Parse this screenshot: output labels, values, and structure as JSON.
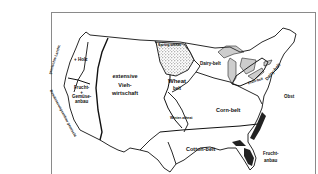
{
  "map": {
    "title": "",
    "subject": "Agricultural belts of the United States (German labels)",
    "colors": {
      "line": "#111111",
      "frame": "#8a8a8a",
      "background": "#ffffff",
      "hatch": "#555555"
    },
    "regions": [
      {
        "id": "holz",
        "label": "+ Holz"
      },
      {
        "id": "frucht-west",
        "label_lines": [
          "Frucht-",
          "+",
          "Gemüse-",
          "anbau"
        ]
      },
      {
        "id": "viehwirtschaft",
        "label_lines": [
          "extensive",
          "Vieh-",
          "wirtschaft"
        ]
      },
      {
        "id": "spring-wheat",
        "label": "Spring-wheat"
      },
      {
        "id": "wheat-belt",
        "label_lines": [
          "Wheat",
          "belt"
        ]
      },
      {
        "id": "dairy-belt-west",
        "label": "Dairy-belt"
      },
      {
        "id": "fruit-belt",
        "label": "Fruit-belt"
      },
      {
        "id": "dairy-belt-east",
        "label": "Dairy-belt"
      },
      {
        "id": "corn-belt",
        "label": "Corn-belt"
      },
      {
        "id": "winter-wheat",
        "label": "Winter-wheat"
      },
      {
        "id": "obst",
        "label": "Obst"
      },
      {
        "id": "cotton-belt",
        "label": "Cotton-belt"
      },
      {
        "id": "frucht-east",
        "label_lines": [
          "Frucht-",
          "anbau"
        ]
      }
    ],
    "side_labels": [
      {
        "id": "gemischte-landw",
        "label": "gemischte Landw."
      },
      {
        "id": "bewaesserung",
        "label": "Bewässerungsanbau gemischt"
      }
    ]
  }
}
